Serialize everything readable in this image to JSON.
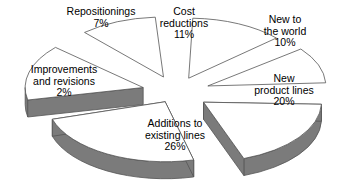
{
  "chart_data": {
    "type": "pie",
    "title": "",
    "subtitle": "",
    "xlabel": "",
    "ylabel": "",
    "legend_position": "none",
    "grid": false,
    "style": "exploded-3d-pie",
    "colors": {
      "background": "#ffffff",
      "slice_top": "#ffffff",
      "slice_side": "#7b7b7b",
      "outline": "#555555",
      "label_text": "#000000"
    },
    "categories": [
      "Cost reductions",
      "New to the world",
      "New product lines",
      "Additions to existing lines",
      "Improvements and revisions",
      "Repositionings"
    ],
    "values": [
      11,
      10,
      20,
      26,
      2,
      7
    ],
    "slices": [
      {
        "name": "cost-reductions",
        "lines": [
          "Cost",
          "reductions"
        ],
        "percent_label": "11%",
        "value": 11,
        "start_angle": 272,
        "end_angle": 318,
        "explode": 30,
        "label_x": 148,
        "label_y": 6,
        "label_w": 72
      },
      {
        "name": "new-to-the-world",
        "lines": [
          "New to",
          "the world"
        ],
        "percent_label": "10%",
        "value": 10,
        "start_angle": 322,
        "end_angle": 357,
        "explode": 34,
        "label_x": 247,
        "label_y": 14,
        "label_w": 76
      },
      {
        "name": "new-product-lines",
        "lines": [
          "New",
          "product lines"
        ],
        "percent_label": "20%",
        "value": 20,
        "start_angle": 2,
        "end_angle": 70,
        "explode": 34,
        "label_x": 238,
        "label_y": 73,
        "label_w": 92
      },
      {
        "name": "additions-to-existing-lines",
        "lines": [
          "Additions to",
          "existing lines"
        ],
        "percent_label": "26%",
        "value": 26,
        "start_angle": 76,
        "end_angle": 163,
        "explode": 22,
        "label_x": 120,
        "label_y": 118,
        "label_w": 110
      },
      {
        "name": "improvements-and-revisions",
        "lines": [
          "Improvements",
          "and revisions"
        ],
        "percent_label": "2%",
        "value": 2,
        "start_angle": 168,
        "end_angle": 222,
        "explode": 34,
        "label_x": 10,
        "label_y": 64,
        "label_w": 108
      },
      {
        "name": "repositionings",
        "lines": [
          "Repositionings"
        ],
        "percent_label": "7%",
        "value": 7,
        "start_angle": 228,
        "end_angle": 266,
        "explode": 32,
        "label_x": 52,
        "label_y": 6,
        "label_w": 98
      }
    ],
    "geometry": {
      "cx": 176,
      "cy": 92,
      "rx": 118,
      "ry": 60,
      "depth": 17
    }
  }
}
